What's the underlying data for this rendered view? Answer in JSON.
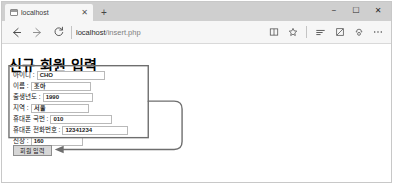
{
  "window": {
    "controls": {
      "minimize": "−",
      "maximize": "☐",
      "close": "✕"
    }
  },
  "tabstrip": {
    "tabs": [
      {
        "title": "localhost",
        "favicon": "page-icon",
        "close": "✕"
      }
    ],
    "new_tab": "+"
  },
  "navbar": {
    "back_icon": "back-arrow-icon",
    "forward_icon": "forward-arrow-icon",
    "refresh_icon": "refresh-icon",
    "address": {
      "host": "localhost",
      "path": "/insert.php",
      "full": "localhost/insert.php"
    },
    "toolbar": [
      {
        "icon": "reading-view-icon",
        "label": "Reading view"
      },
      {
        "icon": "favorites-star-icon",
        "label": "Add to favorites"
      },
      {
        "icon": "hub-lines-icon",
        "label": "Hub"
      },
      {
        "icon": "web-note-pen-icon",
        "label": "Make a Web Note"
      },
      {
        "icon": "share-icon",
        "label": "Share"
      },
      {
        "icon": "more-ellipsis-icon",
        "label": "Settings and more"
      }
    ]
  },
  "page": {
    "title": "신규 회원 입력",
    "fields": [
      {
        "label": "아이디 :",
        "value": "CHO",
        "input_width": 68
      },
      {
        "label": "이름 :",
        "value": "조아",
        "input_width": 60
      },
      {
        "label": "출생년도 :",
        "value": "1990",
        "input_width": 50
      },
      {
        "label": "지역 :",
        "value": "서울",
        "input_width": 58
      },
      {
        "label": "휴대폰 국번 :",
        "value": "010",
        "input_width": 62
      },
      {
        "label": "휴대폰 전화번호 :",
        "value": "12341234",
        "input_width": 66
      },
      {
        "label": "신장 :",
        "value": "160",
        "input_width": 52
      }
    ],
    "submit_label": "회원 입력"
  },
  "annotation": {
    "box_label": "form-fields-highlight-box",
    "arrow_label": "connector-arrow-to-submit",
    "color": "#6e6e6e"
  }
}
